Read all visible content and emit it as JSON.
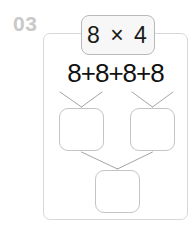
{
  "worksheet": {
    "index_label": "03",
    "product_expression": "8 × 4",
    "sum_expression": "8+8+8+8",
    "answer_boxes": [
      {
        "name": "left-partial-sum",
        "value": ""
      },
      {
        "name": "right-partial-sum",
        "value": ""
      },
      {
        "name": "total-product",
        "value": ""
      }
    ],
    "colors": {
      "index": "#c9c9c9",
      "card_border": "#d8d8d8",
      "chip_border": "#b9b9b9",
      "chip_fill": "#f7f7f7",
      "box_border": "#c4c4c4",
      "connector": "#9a9a9a",
      "text": "#111111",
      "background": "#ffffff"
    }
  }
}
